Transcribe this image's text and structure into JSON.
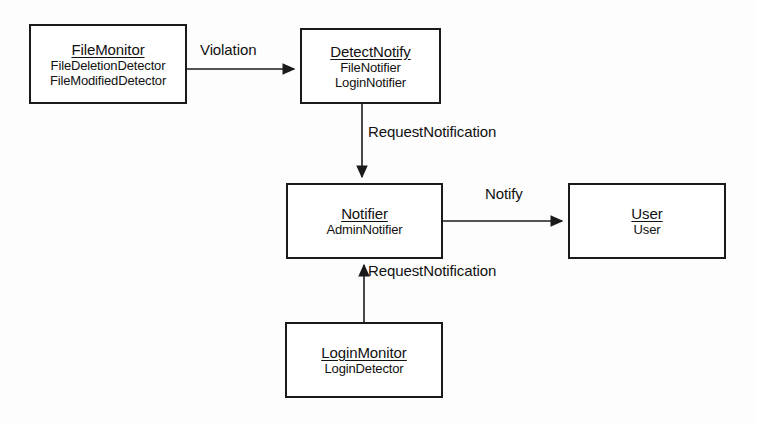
{
  "diagram": {
    "type": "class-collaboration-diagram",
    "background_color": "#fdfdfd",
    "stroke_color": "#1a1a1a",
    "text_color": "#111111",
    "nodes": [
      {
        "id": "file-monitor",
        "title": "FileMonitor",
        "members": [
          "FileDeletionDetector",
          "FileModifiedDetector"
        ],
        "x": 29,
        "y": 24,
        "w": 158,
        "h": 80
      },
      {
        "id": "detect-notify",
        "title": "DetectNotify",
        "members": [
          "FileNotifier",
          "LoginNotifier"
        ],
        "x": 300,
        "y": 28,
        "w": 141,
        "h": 76
      },
      {
        "id": "notifier",
        "title": "Notifier",
        "members": [
          "AdminNotifier"
        ],
        "x": 286,
        "y": 183,
        "w": 157,
        "h": 76
      },
      {
        "id": "user",
        "title": "User",
        "members": [
          "User"
        ],
        "x": 568,
        "y": 183,
        "w": 158,
        "h": 76
      },
      {
        "id": "login-monitor",
        "title": "LoginMonitor",
        "members": [
          "LoginDetector"
        ],
        "x": 285,
        "y": 322,
        "w": 158,
        "h": 76
      }
    ],
    "edges": [
      {
        "id": "edge-violation",
        "label": "Violation",
        "from": "file-monitor",
        "to": "detect-notify",
        "direction": "right",
        "label_x": 200,
        "label_y": 41
      },
      {
        "id": "edge-request-notification-top",
        "label": "RequestNotification",
        "from": "detect-notify",
        "to": "notifier",
        "direction": "down",
        "label_x": 368,
        "label_y": 123
      },
      {
        "id": "edge-notify",
        "label": "Notify",
        "from": "notifier",
        "to": "user",
        "direction": "right",
        "label_x": 485,
        "label_y": 185
      },
      {
        "id": "edge-request-notification-bottom",
        "label": "RequestNotification",
        "from": "login-monitor",
        "to": "notifier",
        "direction": "up",
        "label_x": 368,
        "label_y": 262
      }
    ]
  }
}
